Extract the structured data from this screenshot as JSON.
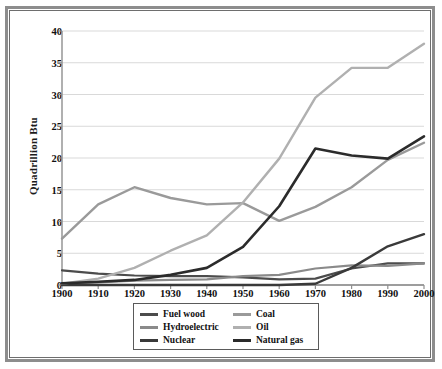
{
  "chart_data": {
    "type": "line",
    "title": "",
    "xlabel": "",
    "ylabel": "Quadrillion Btu",
    "xlim": [
      1900,
      2000
    ],
    "ylim": [
      0,
      40
    ],
    "grid": true,
    "legend_position": "bottom",
    "x": [
      1900,
      1910,
      1920,
      1930,
      1940,
      1950,
      1960,
      1970,
      1980,
      1990,
      2000
    ],
    "xticklabels": [
      "1900",
      "1910",
      "1920",
      "1930",
      "1940",
      "1950",
      "1960",
      "1970",
      "1980",
      "1990",
      "2000"
    ],
    "yticks": [
      0,
      5,
      10,
      15,
      20,
      25,
      30,
      35,
      40
    ],
    "yticklabels": [
      "0",
      "5",
      "10",
      "15",
      "20",
      "25",
      "30",
      "35",
      "40"
    ],
    "series": [
      {
        "name": "Fuel wood",
        "color": "#4c4c4c",
        "width": 2.2,
        "values": [
          2.3,
          1.8,
          1.5,
          1.4,
          1.4,
          1.2,
          0.9,
          1.0,
          2.6,
          3.4,
          3.4
        ]
      },
      {
        "name": "Hydroelectric",
        "color": "#8a8a8a",
        "width": 2.2,
        "values": [
          0.25,
          0.4,
          0.7,
          0.8,
          0.9,
          1.4,
          1.6,
          2.6,
          3.1,
          3.0,
          3.4
        ]
      },
      {
        "name": "Nuclear",
        "color": "#3a3a3a",
        "width": 2.4,
        "values": [
          0,
          0,
          0,
          0,
          0,
          0,
          0,
          0.2,
          2.7,
          6.1,
          8.0
        ]
      },
      {
        "name": "Coal",
        "color": "#9a9a9a",
        "width": 2.4,
        "values": [
          7.3,
          12.7,
          15.4,
          13.7,
          12.7,
          12.9,
          10.1,
          12.3,
          15.4,
          19.7,
          22.4
        ]
      },
      {
        "name": "Oil",
        "color": "#b0b0b0",
        "width": 2.4,
        "values": [
          0.2,
          1.0,
          2.7,
          5.4,
          7.8,
          13.0,
          19.9,
          29.5,
          34.2,
          34.2,
          38.0
        ]
      },
      {
        "name": "Natural gas",
        "color": "#2b2b2b",
        "width": 2.6,
        "values": [
          0.25,
          0.5,
          0.8,
          1.6,
          2.7,
          6.0,
          12.4,
          21.5,
          20.4,
          19.9,
          23.4
        ]
      }
    ],
    "legend_entries": [
      {
        "label": "Fuel wood",
        "color": "#4c4c4c"
      },
      {
        "label": "Coal",
        "color": "#9a9a9a"
      },
      {
        "label": "Hydroelectric",
        "color": "#8a8a8a"
      },
      {
        "label": "Oil",
        "color": "#b0b0b0"
      },
      {
        "label": "Nuclear",
        "color": "#3a3a3a"
      },
      {
        "label": "Natural gas",
        "color": "#2b2b2b"
      }
    ]
  },
  "colors": {
    "frame_outer": "#8d8d8d",
    "frame_inner": "#6e6e6e",
    "grid": "#d9d9d9",
    "axis": "#8f8f8f",
    "text": "#111111"
  }
}
